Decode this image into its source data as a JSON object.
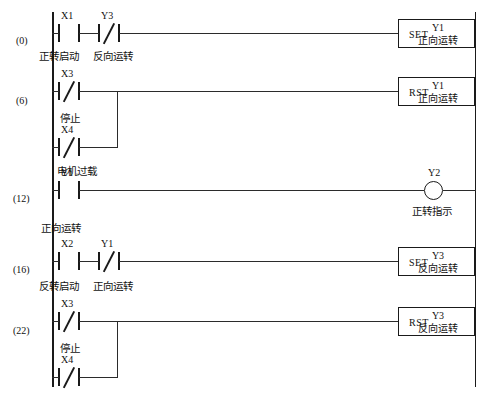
{
  "diagram": {
    "type": "ladder-logic",
    "left_rail_x": 52,
    "right_rail_x": 475
  },
  "steps": [
    {
      "label": "(0)"
    },
    {
      "label": "(6)"
    },
    {
      "label": "(12)"
    },
    {
      "label": "(16)"
    },
    {
      "label": "(22)"
    }
  ],
  "rungs": [
    {
      "step": "(0)",
      "contacts": [
        {
          "id": "X1",
          "type": "NO",
          "comment": "正转启动"
        },
        {
          "id": "Y3",
          "type": "NC",
          "comment": "反向运转"
        }
      ],
      "output": {
        "kind": "instruction",
        "op": "SET",
        "operand": "Y1",
        "operand_cn": "正向运转"
      }
    },
    {
      "step": "(6)",
      "contacts": [
        {
          "id": "X3",
          "type": "NC",
          "comment": "停止"
        },
        {
          "id": "X4",
          "type": "NC",
          "comment": "电机过载"
        }
      ],
      "branch": "parallel",
      "output": {
        "kind": "instruction",
        "op": "RST",
        "operand": "Y1",
        "operand_cn": "正向运转"
      }
    },
    {
      "step": "(12)",
      "contacts": [
        {
          "id": "Y1",
          "type": "NO",
          "comment": "正向运转"
        }
      ],
      "output": {
        "kind": "coil",
        "operand": "Y2",
        "operand_cn": "正转指示"
      }
    },
    {
      "step": "(16)",
      "contacts": [
        {
          "id": "X2",
          "type": "NO",
          "comment": "反转启动"
        },
        {
          "id": "Y1",
          "type": "NC",
          "comment": "正向运转"
        }
      ],
      "output": {
        "kind": "instruction",
        "op": "SET",
        "operand": "Y3",
        "operand_cn": "反向运转"
      }
    },
    {
      "step": "(22)",
      "contacts": [
        {
          "id": "X3",
          "type": "NC",
          "comment": "停止"
        },
        {
          "id": "X4",
          "type": "NC",
          "comment": ""
        }
      ],
      "branch": "parallel",
      "output": {
        "kind": "instruction",
        "op": "RST",
        "operand": "Y3",
        "operand_cn": "反向运转"
      }
    }
  ],
  "labels": {
    "rung0": {
      "x1_id": "X1",
      "y3_id": "Y3",
      "c1": "正转启动",
      "c2": "反向运转"
    },
    "rung6": {
      "a_id": "X3",
      "b_id": "X4",
      "a_cn": "停止",
      "b_cn": "电机过载"
    },
    "rung12": {
      "id": "Y1",
      "cn": "正向运转",
      "coil": "Y2",
      "coil_cn": "正转指示"
    },
    "rung16": {
      "a_id": "X2",
      "b_id": "Y1",
      "a_cn": "反转启动",
      "b_cn": "正向运转"
    },
    "rung22": {
      "a_id": "X3",
      "b_id": "X4",
      "a_cn": "停止"
    }
  },
  "boxes": {
    "set1": {
      "op": "SET",
      "operand": "Y1",
      "cn": "正向运转"
    },
    "rst1": {
      "op": "RST",
      "operand": "Y1",
      "cn": "正向运转"
    },
    "set2": {
      "op": "SET",
      "operand": "Y3",
      "cn": "反向运转"
    },
    "rst2": {
      "op": "RST",
      "operand": "Y3",
      "cn": "反向运转"
    }
  },
  "colors": {
    "line": "#1a1a1a",
    "wire": "#2b2b2b",
    "text": "#111111",
    "background": "#ffffff"
  }
}
